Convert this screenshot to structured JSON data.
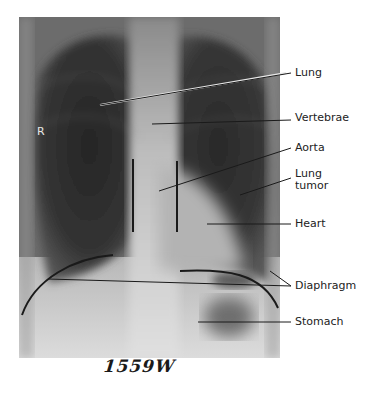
{
  "figure": {
    "side_marker": "R",
    "handwritten_id": "1559W",
    "labels": [
      {
        "id": "lung",
        "text": "Lung"
      },
      {
        "id": "vertebrae",
        "text": "Vertebrae"
      },
      {
        "id": "aorta",
        "text": "Aorta"
      },
      {
        "id": "lung-tumor",
        "text": "Lung tumor",
        "lines": [
          "Lung",
          "tumor"
        ]
      },
      {
        "id": "heart",
        "text": "Heart"
      },
      {
        "id": "diaphragm",
        "text": "Diaphragm"
      },
      {
        "id": "stomach",
        "text": "Stomach"
      }
    ],
    "colors": {
      "background": "#ffffff",
      "label_text": "#222222",
      "leader_line": "#1a1a1a",
      "lung_dark": "#2b2b2b",
      "bone_light": "#d9d9d9"
    }
  }
}
